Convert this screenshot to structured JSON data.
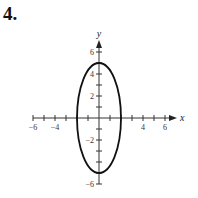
{
  "problem_number": "4.",
  "chart_data": {
    "type": "line",
    "title": "",
    "xlabel": "x",
    "ylabel": "y",
    "xlim": [
      -6,
      6
    ],
    "ylim": [
      -6,
      6
    ],
    "grid": false,
    "x_tick_labels": [
      "-6",
      "-4",
      "4",
      "6"
    ],
    "x_tick_values": [
      -6,
      -4,
      4,
      6
    ],
    "y_tick_labels": [
      "6",
      "4",
      "2",
      "-2",
      "-6"
    ],
    "y_tick_values": [
      6,
      4,
      2,
      -2,
      -6
    ],
    "series": [
      {
        "name": "ellipse",
        "center": [
          0,
          0
        ],
        "semi_axis_x": 2,
        "semi_axis_y": 5,
        "key_points": [
          [
            2,
            0
          ],
          [
            0,
            5
          ],
          [
            -2,
            0
          ],
          [
            0,
            -5
          ]
        ]
      }
    ]
  }
}
